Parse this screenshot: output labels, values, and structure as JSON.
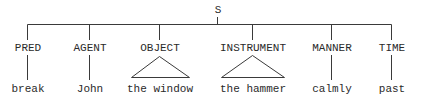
{
  "diagram": {
    "type": "case-grammar-tree",
    "root": {
      "label": "S",
      "x": 217
    },
    "line_color": "#3a3a3a",
    "text_color": "#2a2a2a",
    "nodes": [
      {
        "label": "PRED",
        "leaf": "break",
        "x": 27,
        "leaf_connector": "line"
      },
      {
        "label": "AGENT",
        "leaf": "John",
        "x": 89,
        "leaf_connector": "line"
      },
      {
        "label": "OBJECT",
        "leaf": "the window",
        "x": 159,
        "leaf_connector": "triangle"
      },
      {
        "label": "INSTRUMENT",
        "leaf": "the hammer",
        "x": 252,
        "leaf_connector": "triangle"
      },
      {
        "label": "MANNER",
        "leaf": "calmly",
        "x": 331,
        "leaf_connector": "line"
      },
      {
        "label": "TIME",
        "leaf": "past",
        "x": 391,
        "leaf_connector": "line"
      }
    ]
  }
}
